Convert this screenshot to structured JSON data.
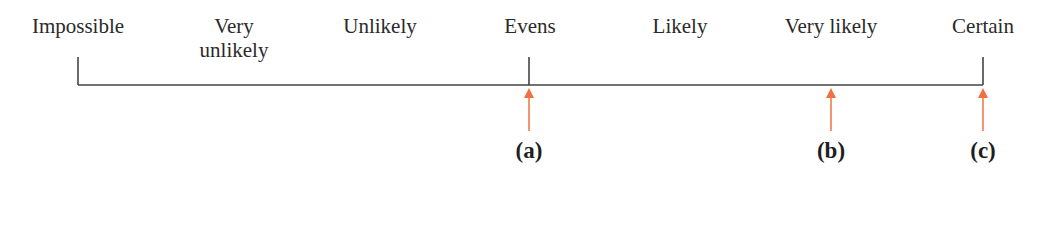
{
  "scale": {
    "labels": [
      {
        "text": "Impossible",
        "x": 78
      },
      {
        "text": "Very",
        "text2": "unlikely",
        "x": 234
      },
      {
        "text": "Unlikely",
        "x": 380
      },
      {
        "text": "Evens",
        "x": 530
      },
      {
        "text": "Likely",
        "x": 680
      },
      {
        "text": "Very likely",
        "x": 831
      },
      {
        "text": "Certain",
        "x": 983
      }
    ],
    "line": {
      "x1": 78,
      "x2": 983,
      "y": 85
    },
    "ticks": [
      78,
      529,
      983
    ]
  },
  "markers": [
    {
      "label": "(a)",
      "x": 529
    },
    {
      "label": "(b)",
      "x": 831
    },
    {
      "label": "(c)",
      "x": 983
    }
  ],
  "colors": {
    "line": "#444444",
    "arrow": "#f07040"
  }
}
